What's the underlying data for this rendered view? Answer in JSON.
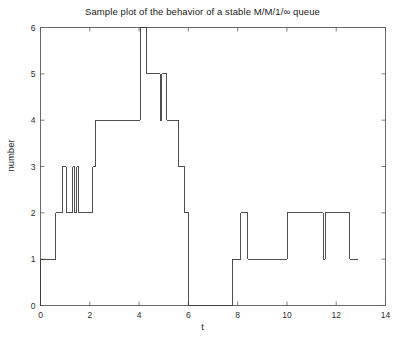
{
  "chart_data": {
    "type": "line",
    "title": "Sample plot of the behavior of a stable M/M/1/∞ queue",
    "xlabel": "t",
    "ylabel": "number",
    "xlim": [
      0,
      14
    ],
    "ylim": [
      0,
      6
    ],
    "xticks": [
      0,
      2,
      4,
      6,
      8,
      10,
      12,
      14
    ],
    "yticks": [
      0,
      1,
      2,
      3,
      4,
      5,
      6
    ],
    "xtick_labels": [
      "0",
      "2",
      "4",
      "6",
      "8",
      "10",
      "12",
      "14"
    ],
    "ytick_labels": [
      "0",
      "1",
      "2",
      "3",
      "4",
      "5",
      "6"
    ],
    "grid": false,
    "legend": null,
    "line_color": "#3c3c3c",
    "line_width": 0.9,
    "step_style": "post",
    "series": [
      {
        "name": "N(t)",
        "x": [
          0.0,
          0.62,
          0.88,
          1.05,
          1.3,
          1.38,
          1.48,
          1.58,
          1.68,
          2.12,
          2.22,
          3.05,
          4.05,
          4.32,
          4.82,
          4.92,
          5.12,
          5.6,
          5.85,
          6.02,
          7.78,
          8.12,
          8.42,
          10.02,
          11.48,
          11.55,
          12.55,
          12.88
        ],
        "y": [
          1,
          2,
          3,
          2,
          3,
          2,
          3,
          2,
          2,
          3,
          4,
          4,
          6,
          5,
          5,
          4,
          4,
          3,
          2,
          0,
          1,
          2,
          1,
          2,
          1,
          2,
          1,
          1
        ],
        "steps": [
          {
            "t_start": 0.0,
            "t_end": 0.62,
            "value": 1
          },
          {
            "t_start": 0.62,
            "t_end": 0.88,
            "value": 2
          },
          {
            "t_start": 0.88,
            "t_end": 1.05,
            "value": 3
          },
          {
            "t_start": 1.05,
            "t_end": 1.3,
            "value": 2
          },
          {
            "t_start": 1.3,
            "t_end": 1.38,
            "value": 3
          },
          {
            "t_start": 1.38,
            "t_end": 1.48,
            "value": 2
          },
          {
            "t_start": 1.48,
            "t_end": 1.55,
            "value": 3
          },
          {
            "t_start": 1.55,
            "t_end": 2.12,
            "value": 2
          },
          {
            "t_start": 2.12,
            "t_end": 2.22,
            "value": 3
          },
          {
            "t_start": 2.22,
            "t_end": 3.05,
            "value": 4
          },
          {
            "t_start": 3.05,
            "t_end": 4.05,
            "value": 4
          },
          {
            "t_start": 4.05,
            "t_end": 4.32,
            "value": 6
          },
          {
            "t_start": 4.32,
            "t_end": 4.85,
            "value": 5
          },
          {
            "t_start": 4.85,
            "t_end": 4.92,
            "value": 4
          },
          {
            "t_start": 4.92,
            "t_end": 5.12,
            "value": 5
          },
          {
            "t_start": 5.12,
            "t_end": 5.6,
            "value": 4
          },
          {
            "t_start": 5.6,
            "t_end": 5.85,
            "value": 3
          },
          {
            "t_start": 5.85,
            "t_end": 6.02,
            "value": 2
          },
          {
            "t_start": 6.02,
            "t_end": 7.78,
            "value": 0
          },
          {
            "t_start": 7.78,
            "t_end": 8.12,
            "value": 1
          },
          {
            "t_start": 8.12,
            "t_end": 8.42,
            "value": 2
          },
          {
            "t_start": 8.42,
            "t_end": 10.02,
            "value": 1
          },
          {
            "t_start": 10.02,
            "t_end": 11.48,
            "value": 2
          },
          {
            "t_start": 11.48,
            "t_end": 11.55,
            "value": 1
          },
          {
            "t_start": 11.55,
            "t_end": 12.55,
            "value": 2
          },
          {
            "t_start": 12.55,
            "t_end": 12.88,
            "value": 1
          }
        ]
      }
    ]
  }
}
